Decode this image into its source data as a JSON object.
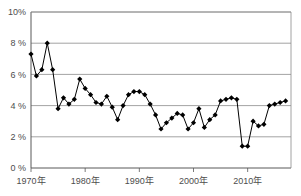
{
  "chart_data": {
    "type": "line",
    "title": "",
    "xlabel": "",
    "ylabel": "",
    "ylim": [
      0,
      10
    ],
    "xlim": [
      1970,
      2018
    ],
    "grid": true,
    "legend": false,
    "marker": "diamond",
    "y_ticks": [
      {
        "value": 0,
        "label": "0 %"
      },
      {
        "value": 2,
        "label": "2 %"
      },
      {
        "value": 4,
        "label": "4 %"
      },
      {
        "value": 6,
        "label": "6 %"
      },
      {
        "value": 8,
        "label": "8 %"
      },
      {
        "value": 10,
        "label": "10%"
      }
    ],
    "x_ticks": [
      {
        "value": 1970,
        "label": "1970年"
      },
      {
        "value": 1980,
        "label": "1980年"
      },
      {
        "value": 1990,
        "label": "1990年"
      },
      {
        "value": 2000,
        "label": "2000年"
      },
      {
        "value": 2010,
        "label": "2010年"
      }
    ],
    "x": [
      1970,
      1971,
      1972,
      1973,
      1974,
      1975,
      1976,
      1977,
      1978,
      1979,
      1980,
      1981,
      1982,
      1983,
      1984,
      1985,
      1986,
      1987,
      1988,
      1989,
      1990,
      1991,
      1992,
      1993,
      1994,
      1995,
      1996,
      1997,
      1998,
      1999,
      2000,
      2001,
      2002,
      2003,
      2004,
      2005,
      2006,
      2007,
      2008,
      2009,
      2010,
      2011,
      2012,
      2013,
      2014,
      2015,
      2016,
      2017
    ],
    "values": [
      7.3,
      5.9,
      6.3,
      8.0,
      6.3,
      3.8,
      4.5,
      4.1,
      4.4,
      5.7,
      5.1,
      4.7,
      4.2,
      4.1,
      4.6,
      3.9,
      3.1,
      4.0,
      4.7,
      4.9,
      4.9,
      4.7,
      4.1,
      3.4,
      2.5,
      2.9,
      3.2,
      3.5,
      3.4,
      2.5,
      2.9,
      3.8,
      2.6,
      3.1,
      3.4,
      4.3,
      4.4,
      4.5,
      4.4,
      1.4,
      1.4,
      3.0,
      2.7,
      2.8,
      4.0,
      4.1,
      4.2,
      4.3
    ],
    "series": [
      {
        "name": "",
        "color": "#000000",
        "values": [
          7.3,
          5.9,
          6.3,
          8.0,
          6.3,
          3.8,
          4.5,
          4.1,
          4.4,
          5.7,
          5.1,
          4.7,
          4.2,
          4.1,
          4.6,
          3.9,
          3.1,
          4.0,
          4.7,
          4.9,
          4.9,
          4.7,
          4.1,
          3.4,
          2.5,
          2.9,
          3.2,
          3.5,
          3.4,
          2.5,
          2.9,
          3.8,
          2.6,
          3.1,
          3.4,
          4.3,
          4.4,
          4.5,
          4.4,
          1.4,
          1.4,
          3.0,
          2.7,
          2.8,
          4.0,
          4.1,
          4.2,
          4.3
        ]
      }
    ],
    "colors": {
      "line": "#000000",
      "marker": "#000000",
      "grid": "#8c8c8c",
      "axis": "#595959",
      "text": "#4d4d4d",
      "background": "#ffffff"
    }
  }
}
